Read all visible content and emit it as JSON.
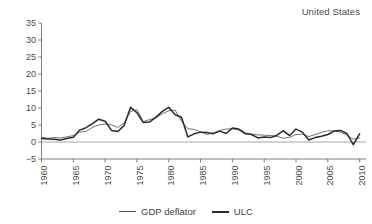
{
  "chart_data": {
    "type": "line",
    "title": "United States",
    "xlabel": "",
    "ylabel": "",
    "xlim": [
      1960,
      2011
    ],
    "ylim": [
      -5,
      35
    ],
    "yticks": [
      -5,
      0,
      5,
      10,
      15,
      20,
      25,
      30,
      35
    ],
    "xticks": [
      1960,
      1965,
      1970,
      1975,
      1980,
      1985,
      1990,
      1995,
      2000,
      2005,
      2010
    ],
    "grid": false,
    "legend_position": "bottom-center",
    "x": [
      1960,
      1961,
      1962,
      1963,
      1964,
      1965,
      1966,
      1967,
      1968,
      1969,
      1970,
      1971,
      1972,
      1973,
      1974,
      1975,
      1976,
      1977,
      1978,
      1979,
      1980,
      1981,
      1982,
      1983,
      1984,
      1985,
      1986,
      1987,
      1988,
      1989,
      1990,
      1991,
      1992,
      1993,
      1994,
      1995,
      1996,
      1997,
      1998,
      1999,
      2000,
      2001,
      2002,
      2003,
      2004,
      2005,
      2006,
      2007,
      2008,
      2009,
      2010
    ],
    "series": [
      {
        "name": "GDP deflator",
        "line_style": "thin",
        "color": "#58585a",
        "values": [
          1.4,
          1.1,
          1.3,
          1.2,
          1.5,
          1.9,
          2.9,
          3.1,
          4.3,
          5.0,
          5.3,
          5.0,
          4.3,
          5.6,
          9.0,
          9.5,
          6.0,
          6.6,
          7.1,
          8.3,
          9.2,
          9.4,
          6.1,
          3.9,
          3.7,
          3.0,
          2.2,
          2.7,
          3.4,
          3.8,
          3.9,
          3.5,
          2.3,
          2.3,
          2.1,
          2.0,
          1.9,
          1.7,
          1.1,
          1.4,
          2.2,
          2.3,
          1.6,
          2.2,
          2.8,
          3.3,
          3.3,
          2.9,
          2.0,
          0.8,
          1.2
        ],
        "marker": "none"
      },
      {
        "name": "ULC",
        "line_style": "thick",
        "color": "#2b2b2b",
        "values": [
          1.0,
          0.9,
          0.8,
          0.6,
          1.0,
          1.4,
          3.5,
          4.2,
          5.4,
          6.7,
          6.1,
          3.4,
          3.1,
          4.9,
          10.2,
          8.6,
          5.7,
          5.9,
          7.3,
          9.0,
          10.2,
          8.0,
          7.3,
          1.5,
          2.4,
          2.9,
          2.8,
          2.4,
          3.2,
          2.5,
          4.1,
          3.8,
          2.6,
          2.2,
          1.2,
          1.5,
          1.3,
          2.0,
          3.3,
          1.9,
          3.8,
          2.9,
          0.6,
          1.3,
          1.7,
          2.2,
          3.2,
          3.4,
          2.5,
          -0.8,
          2.4
        ],
        "marker": "none"
      }
    ]
  },
  "legend": [
    {
      "label": "GDP deflator",
      "style": "thin"
    },
    {
      "label": "ULC",
      "style": "thick"
    }
  ]
}
